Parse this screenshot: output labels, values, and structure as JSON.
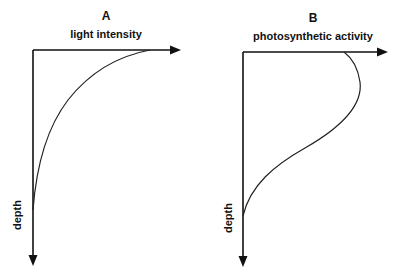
{
  "panels": [
    {
      "id": "A",
      "letter": "A",
      "x_axis_label": "light intensity",
      "y_axis_label": "depth",
      "curve_description": "Light intensity is highest at the surface and decreases exponentially with depth"
    },
    {
      "id": "B",
      "letter": "B",
      "x_axis_label": "photosynthetic activity",
      "y_axis_label": "depth",
      "curve_description": "Photosynthetic activity is slightly reduced at the very surface, peaks just below it, then decreases with depth"
    }
  ],
  "colors": {
    "line": "#111111",
    "background": "#ffffff"
  }
}
